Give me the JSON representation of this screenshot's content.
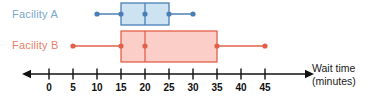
{
  "chart_data": {
    "type": "box",
    "title": "",
    "xlabel": "Wait time (minutes)",
    "ylabel": "",
    "xlim": [
      -3,
      48
    ],
    "xticks": [
      0,
      5,
      10,
      15,
      20,
      25,
      30,
      35,
      40,
      45
    ],
    "xtick_labels": [
      "0",
      "5",
      "10",
      "15",
      "20",
      "25",
      "30",
      "35",
      "40",
      "45"
    ],
    "grid": false,
    "legend": "left-labels",
    "axis_arrows": "both",
    "series": [
      {
        "name": "Facility A",
        "color": "#4a7fb5",
        "fill": "#cde3f2",
        "label_color": "#79a8cc",
        "min": 10,
        "q1": 15,
        "median": 20,
        "q3": 25,
        "max": 30,
        "iqr": 10,
        "range": 20
      },
      {
        "name": "Facility B",
        "color": "#e2604a",
        "fill": "#fbcfc8",
        "label_color": "#e8806a",
        "min": 5,
        "q1": 15,
        "median": 20,
        "q3": 35,
        "max": 45,
        "iqr": 20,
        "range": 40
      }
    ]
  },
  "labels": {
    "facility_a": "Facility A",
    "facility_b": "Facility B",
    "axis_title_line1": "Wait time",
    "axis_title_line2": "(minutes)"
  },
  "axis": {
    "ticks": [
      "0",
      "5",
      "10",
      "15",
      "20",
      "25",
      "30",
      "35",
      "40",
      "45"
    ]
  },
  "colors": {
    "blue_stroke": "#4a7fb5",
    "blue_fill": "#cde3f2",
    "blue_label": "#79a8cc",
    "red_stroke": "#e2604a",
    "red_fill": "#fbcfc8",
    "red_label": "#e8806a",
    "axis": "#111111"
  }
}
